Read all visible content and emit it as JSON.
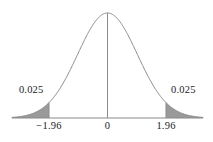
{
  "figure": {
    "name": "standard-normal-two-tailed-critical-region-plot",
    "background_color": "#ffffff",
    "curve_color": "#8a8a8a",
    "shading_color": "#9a9a9a",
    "axis_color": "#8a8a8a",
    "text_color": "#1c1c1c"
  },
  "labels": {
    "tail_area_left": "0.025",
    "tail_area_right": "0.025",
    "tick_left": "−1.96",
    "tick_center": "0",
    "tick_right": "1.96"
  },
  "chart_data": {
    "type": "area",
    "title": "",
    "subtitle": "",
    "xlabel": "",
    "ylabel": "",
    "grid": false,
    "legend_position": "none",
    "distribution": "standard normal",
    "mean": 0,
    "sd": 1,
    "xlim": [
      -3.2,
      3.2
    ],
    "ylim": [
      0,
      0.42
    ],
    "tick_values": [
      -1.96,
      0,
      1.96
    ],
    "tick_labels": [
      "−1.96",
      "0",
      "1.96"
    ],
    "annotations": [
      {
        "text": "0.025",
        "x": -2.55,
        "y": 0.105,
        "describes": "left-tail-area"
      },
      {
        "text": "0.025",
        "x": 2.55,
        "y": 0.105,
        "describes": "right-tail-area"
      }
    ],
    "shaded_regions": [
      {
        "name": "left-tail",
        "from": -3.2,
        "to": -1.96,
        "area": 0.025
      },
      {
        "name": "right-tail",
        "from": 1.96,
        "to": 3.2,
        "area": 0.025
      }
    ],
    "vertical_lines": [
      {
        "name": "center-line",
        "x": 0,
        "from_y": 0,
        "to_y": 0.3989
      },
      {
        "name": "left-cutoff-line",
        "x": -1.96,
        "from_y": 0,
        "to_y": 0.0584
      },
      {
        "name": "right-cutoff-line",
        "x": 1.96,
        "from_y": 0,
        "to_y": 0.0584
      }
    ],
    "x": [
      -3.2,
      -3.0,
      -2.8,
      -2.6,
      -2.4,
      -2.2,
      -2.0,
      -1.96,
      -1.8,
      -1.6,
      -1.4,
      -1.2,
      -1.0,
      -0.8,
      -0.6,
      -0.4,
      -0.2,
      0.0,
      0.2,
      0.4,
      0.6,
      0.8,
      1.0,
      1.2,
      1.4,
      1.6,
      1.8,
      1.96,
      2.0,
      2.2,
      2.4,
      2.6,
      2.8,
      3.0,
      3.2
    ],
    "y": [
      0.0024,
      0.0044,
      0.0079,
      0.0136,
      0.0224,
      0.0355,
      0.054,
      0.0584,
      0.079,
      0.1109,
      0.1497,
      0.1942,
      0.242,
      0.2897,
      0.3332,
      0.3683,
      0.391,
      0.3989,
      0.391,
      0.3683,
      0.3332,
      0.2897,
      0.242,
      0.1942,
      0.1497,
      0.1109,
      0.079,
      0.0584,
      0.054,
      0.0355,
      0.0224,
      0.0136,
      0.0079,
      0.0044,
      0.0024
    ]
  }
}
